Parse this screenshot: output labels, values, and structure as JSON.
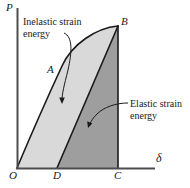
{
  "figure": {
    "type": "load-deflection-diagram",
    "axes": {
      "y_label": "P",
      "x_label": "δ",
      "origin_label": "O"
    },
    "points": [
      {
        "name": "origin",
        "label": "O",
        "x": 17,
        "y": 168
      },
      {
        "name": "unload-intercept",
        "label": "D",
        "x": 57,
        "y": 168
      },
      {
        "name": "max-deflection",
        "label": "C",
        "x": 118,
        "y": 168
      },
      {
        "name": "peak-load",
        "label": "B",
        "x": 118,
        "y": 26
      },
      {
        "name": "curve-midpoint",
        "label": "A",
        "x": 54,
        "y": 78
      }
    ],
    "regions": [
      {
        "name": "inelastic-strain-energy",
        "label_line1": "Inelastic strain",
        "label_line2": "energy",
        "fill": "#d9d9d9"
      },
      {
        "name": "elastic-strain-energy",
        "label_line1": "Elastic strain",
        "label_line2": "energy",
        "fill": "#9e9e9e"
      }
    ],
    "colors": {
      "inelastic_fill": "#d9d9d9",
      "elastic_fill": "#9e9e9e",
      "stroke": "#1a1a1a",
      "axis": "#555555",
      "background": "#ffffff"
    }
  }
}
